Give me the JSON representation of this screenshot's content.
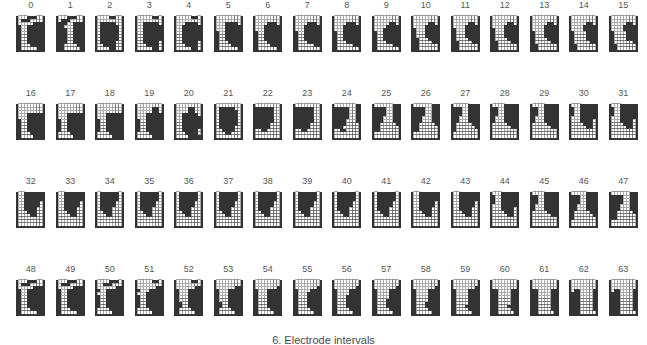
{
  "figure": {
    "title_caption": "6. Electrode intervals",
    "tile_count": 64,
    "rows": 4,
    "columns": 16,
    "cell_columns": 8,
    "cell_rows": 11,
    "colors": {
      "filled": "#333333",
      "empty": "#ffffff",
      "grid_line": "#444444",
      "background": "#ffffff",
      "label_text": "#555555",
      "caption_text": "#4a4a4a"
    },
    "labels": [
      "0",
      "1",
      "2",
      "3",
      "4",
      "5",
      "6",
      "7",
      "8",
      "9",
      "10",
      "11",
      "12",
      "13",
      "14",
      "15",
      "16",
      "17",
      "18",
      "19",
      "20",
      "21",
      "22",
      "23",
      "24",
      "25",
      "26",
      "27",
      "28",
      "29",
      "30",
      "31",
      "32",
      "33",
      "34",
      "35",
      "36",
      "37",
      "38",
      "39",
      "40",
      "41",
      "42",
      "43",
      "44",
      "45",
      "46",
      "47",
      "48",
      "49",
      "50",
      "51",
      "52",
      "53",
      "54",
      "55",
      "56",
      "57",
      "58",
      "59",
      "60",
      "61",
      "62",
      "63"
    ],
    "patterns": [
      "00011100011100000000011110011111100111111001111110011111100111111001111110001111100000110000",
      "00011100011100001110011111000111111001111110011111100111111001111110011111000011110000011100",
      "00001100000000000111110001111110011111100111111001111110011111100111110000111100000011000000",
      "00000110000000000011111000111111001111110011111100111111001111110011111000011110000001100000",
      "00000110000000000001111000111111001111110011111100111111001111110011111000011110000001100000",
      "00000000000000000001111000011111000111111001111110011111100111111000111110000111100000011000",
      "00000000000000000000111000011111000111111001111110011111100111111000111110000111100000011000",
      "00000000000000000000111000011111000111111001111110011111100111111000111110000011100000001100",
      "00000000000000000000111000011111000111111001111110011111100111111000111110000011100000001100",
      "00000000000000000000011000001111000111111001111110011111100111111000111110000011100000001100",
      "00000000000000000000011000001111100011111000111110001111110001111100001111000000110000000110",
      "00000000000000000000011000001111100011111000111110001111100001111100001111000000110000000110",
      "00000000000000000000011000001111100011111000111110001111100001111100001111000000110000000110",
      "00000000000000000000011000001111000011111000111110001111100001111000001111000000110000000110",
      "00000000000000000000011000001111000011111000011110000111100001111000001111000000110000000110",
      "00000000000000000000011000001111000011111000011110000111100001111000000111000000110000000110",
      "00000000000000000000000000011111000111111001111110011111100111111001111110001111100001111000",
      "00000000000000000000000000011111000111111001111110011111100111111001111100001111000001111000",
      "00000000000000000000000000011111000111111001111110011111100111111001111100001111000001111000",
      "00000000000001100000011000011111000111111001111110011111100111111001111100001111000001111000",
      "00000000000011000000110000111110001111110011111100111111001111110011111000011110000011110000",
      "00000000011111000111111001111110011111100111111001111110011111000011110000011000000000000000",
      "00000000111111001111110011111100111111001111110011111000111110000011000000000000000000000000",
      "00000000111111001111110011111100111111001111110011111000111110000011000000000000000000000000",
      "00000001111110011111100111111001111110011111000111110000111000000011000000000000000000000000",
      "00000011111100111111001111110011111000111110001111000001110000001100000000000000000000000000",
      "00000011111100111111001111110011111000111110001111000001110000001100000000000000000000000000",
      "00000111111001111110011111100111110001111100011110000011100000011000000000000000000000000000",
      "00001111110011111100111111001111100011111000111100000111000000110000000000000000000000000000",
      "00001111110011111100111111001111100011111000111100000111000000110000000000000000000000000000",
      "00011111100111111001111110011111000111110001111000001110000001100000000000000000000000000000",
      "00011111100111111001111110011111000111110001111000001110000001100000000000000000000000000000",
      "00111111001111110011111100111110001111100011110000011100000011000000000000000000000000000000",
      "00111111001111110011111100111110001111100011110000011100000011000000000000000000000000000000",
      "01111110011111100111111001111100011111000111100000111000000110000000000000000000000000000000",
      "01111110011111100111111001111100011111000111100000111000000110000000000000000000000000000000",
      "01111110011111100111111001111100011111000111100000111000000110000000000000000000000000000000",
      "01111110011111100111111001111100011111000111100000111000000110000000000000000000000000000000",
      "01111110011111100111111001111100011111000111100000111000000110000000000000000000000000000000",
      "01111110011111100111111001111100011111000111100000111000000110000000000000000000000000000000",
      "01111110011111100111111001111100011111000111100000111000000110000000000000000000000000000000",
      "01111110011111100111111001111100011111000111100000111000000110000000000000000000000000000000",
      "00111111001111110011111100111110001111100011110000011100000011000000000000000000000000000000",
      "00111111001111110011111100111110001111100011110000011100000011000000000000000000000000000000",
      "00011111100111111001111110011111000111110001111000001110000001100000000000000000000000000000",
      "00001111110011111100111111001111100011111000111100000111000000110000000000000000000000000000",
      "00000111111001111110011111100111110001111100011110000011100000011000000000000000000000000000",
      "00000011111100111111001111110011111000111110001111000001110000001100000000000000000000000000",
      "00011100011100000000011110011111100111111001111110011111100111111001111110001111100000110000",
      "00011100011100000000011110011111100111111001111110011111100111111001111110001111100000110000",
      "00001110001110000000001110011111000111111001111110011111100111111001111100001111000001110000",
      "00000110000000000000001110001111000111111001111110011111100111111001111100001111000001110000",
      "00000110000000000000001110001111100011111000111110001111110011111100111110000111100000111000",
      "00000000000000000000001110001111100011111000111110001111110011111100111110000111100000111000",
      "00000000000000000000000110001111100011111000111110001111100011111000111110000111100000111000",
      "00000000000000000000000110000111100011111000111110001111100011111000111110000111100000111000",
      "00000000000000000000000110000111100001111000111110001111100011111000111110000111100000111000",
      "00000000000000000000000110000111100001111000011110001111100011111000111110000111100000111000",
      "00000000000000000000000110000111100001111000011110000111100011111000111110000111100000111000",
      "00000000000000000000000110000111100001111000011110000111100001111000111110000111100000111000",
      "00000000000000000000000011000011110000111100001111000011110000111100011111000011110000011100",
      "00000000000000000000000011000011110000111100001111000011110000111100001111000011110000011100",
      "00000000000000000000000001100001111000011110000111100001111000011110000111100001111000001110",
      "00000000000000000000000001100001111000011110000111100001111000011110000111100001111000001110"
    ]
  }
}
